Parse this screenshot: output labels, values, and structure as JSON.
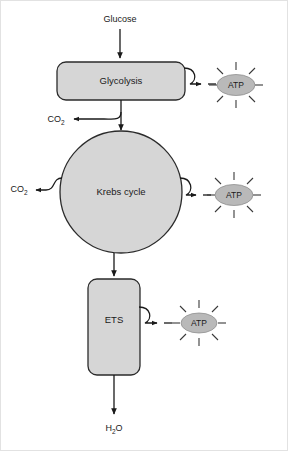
{
  "figure": {
    "background_color": "#ffffff",
    "shape_fill_color": "#d6d6d6",
    "shape_stroke_color": "#2b2b2b",
    "atp_fill_color": "#b9b9b9",
    "line_color": "#1a1a1a"
  },
  "inputs": {
    "glucose": {
      "label": "Glucose",
      "name": "glucose-input-label"
    }
  },
  "stages": [
    {
      "id": "glycolysis",
      "label": "Glycolysis",
      "shape": "rounded-rect"
    },
    {
      "id": "krebs-cycle",
      "label": "Krebs cycle",
      "shape": "circle"
    },
    {
      "id": "ets",
      "label": "ETS",
      "shape": "rounded-rect-tall"
    }
  ],
  "products": {
    "atp": [
      {
        "label": "ATP",
        "source": "glycolysis"
      },
      {
        "label": "ATP",
        "source": "krebs-cycle"
      },
      {
        "label": "ATP",
        "source": "ets"
      }
    ],
    "co2": [
      {
        "label": "CO",
        "subscript": "2",
        "source": "glycolysis-to-krebs"
      },
      {
        "label": "CO",
        "subscript": "2",
        "source": "krebs-cycle"
      }
    ],
    "water": {
      "label": "H",
      "subscript": "2",
      "label_tail": "O",
      "source": "ets"
    }
  }
}
